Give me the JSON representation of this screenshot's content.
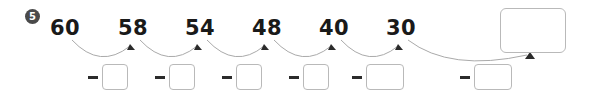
{
  "exercise": {
    "item_number": "5",
    "sequence": [
      {
        "value": "60",
        "x": 42
      },
      {
        "value": "58",
        "x": 110
      },
      {
        "value": "54",
        "x": 177
      },
      {
        "value": "48",
        "x": 244
      },
      {
        "value": "40",
        "x": 311
      },
      {
        "value": "30",
        "x": 378
      }
    ],
    "operations": [
      {
        "operator": "−",
        "answer": "",
        "left": 88,
        "size": "small"
      },
      {
        "operator": "−",
        "answer": "",
        "left": 155,
        "size": "small"
      },
      {
        "operator": "−",
        "answer": "",
        "left": 222,
        "size": "small"
      },
      {
        "operator": "−",
        "answer": "",
        "left": 289,
        "size": "small"
      },
      {
        "operator": "−",
        "answer": "",
        "left": 352,
        "size": "wide"
      },
      {
        "operator": "−",
        "answer": "",
        "left": 460,
        "size": "wide"
      }
    ],
    "final_answer": "",
    "colors": {
      "marker_fill": "#4a4a4a",
      "number_text": "#1a1a1a",
      "box_border": "#b9b9b9",
      "arc_stroke": "#aaaaaa",
      "arrow_fill": "#2b2b2b",
      "background": "#ffffff"
    }
  }
}
